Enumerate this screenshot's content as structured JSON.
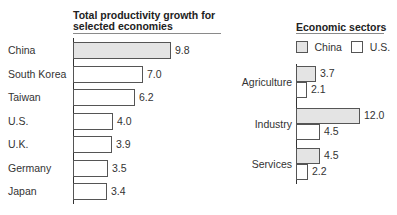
{
  "chart_data": [
    {
      "type": "bar",
      "orientation": "horizontal",
      "title": "Total productivity growth for selected economies",
      "categories": [
        "China",
        "South Korea",
        "Taiwan",
        "U.S.",
        "U.K.",
        "Germany",
        "Japan"
      ],
      "values": [
        9.8,
        7.0,
        6.2,
        4.0,
        3.9,
        3.5,
        3.4
      ],
      "value_labels": [
        "9.8",
        "7.0",
        "6.2",
        "4.0",
        "3.9",
        "3.5",
        "3.4"
      ],
      "highlight": "China",
      "xlabel": "",
      "ylabel": "",
      "grid": false
    },
    {
      "type": "bar",
      "orientation": "horizontal",
      "title": "Economic sectors",
      "categories": [
        "Agriculture",
        "Industry",
        "Services"
      ],
      "series": [
        {
          "name": "China",
          "values": [
            3.7,
            12.0,
            4.5
          ],
          "value_labels": [
            "3.7",
            "12.0",
            "4.5"
          ],
          "color": "#e4e4e4"
        },
        {
          "name": "U.S.",
          "values": [
            2.1,
            4.5,
            2.2
          ],
          "value_labels": [
            "2.1",
            "4.5",
            "2.2"
          ],
          "color": "#ffffff"
        }
      ],
      "legend_position": "top",
      "grid": false
    }
  ],
  "left": {
    "title": "Total productivity growth for selected economies",
    "rows": [
      {
        "label": "China",
        "value": "9.8"
      },
      {
        "label": "South Korea",
        "value": "7.0"
      },
      {
        "label": "Taiwan",
        "value": "6.2"
      },
      {
        "label": "U.S.",
        "value": "4.0"
      },
      {
        "label": "U.K.",
        "value": "3.9"
      },
      {
        "label": "Germany",
        "value": "3.5"
      },
      {
        "label": "Japan",
        "value": "3.4"
      }
    ]
  },
  "right": {
    "title": "Economic sectors",
    "legend": {
      "china": "China",
      "us": "U.S."
    },
    "groups": [
      {
        "label": "Agriculture",
        "china": "3.7",
        "us": "2.1"
      },
      {
        "label": "Industry",
        "china": "12.0",
        "us": "4.5"
      },
      {
        "label": "Services",
        "china": "4.5",
        "us": "2.2"
      }
    ]
  }
}
